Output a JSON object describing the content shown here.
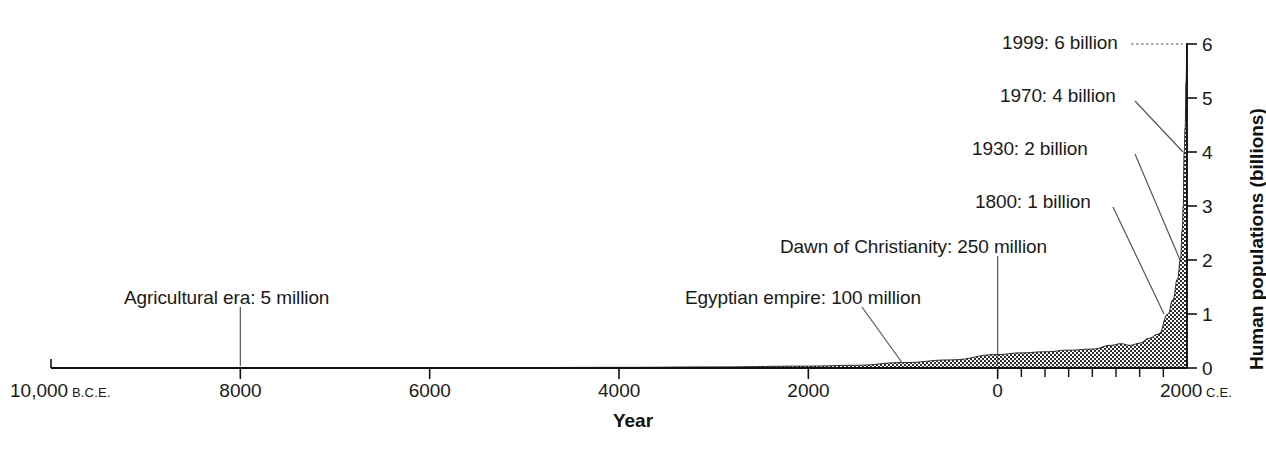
{
  "chart_data": {
    "type": "area",
    "title": "",
    "xlabel": "Year",
    "ylabel": "Human populations (billions)",
    "xlim": [
      -10000,
      2000
    ],
    "ylim": [
      0,
      6
    ],
    "grid": false,
    "legend": false,
    "x_tick_labels": [
      {
        "value": -10000,
        "text": "10,000",
        "era": "B.C.E."
      },
      {
        "value": -8000,
        "text": "8000",
        "era": ""
      },
      {
        "value": -6000,
        "text": "6000",
        "era": ""
      },
      {
        "value": -4000,
        "text": "4000",
        "era": ""
      },
      {
        "value": -2000,
        "text": "2000",
        "era": ""
      },
      {
        "value": 0,
        "text": "0",
        "era": ""
      },
      {
        "value": 2000,
        "text": "2000",
        "era": "C.E."
      }
    ],
    "x_minor_ticks": [
      250,
      500,
      750,
      1000,
      1250,
      1500,
      1750
    ],
    "y_tick_labels": [
      "0",
      "1",
      "2",
      "3",
      "4",
      "5",
      "6"
    ],
    "y_ticks": [
      0,
      1,
      2,
      3,
      4,
      5,
      6
    ],
    "series": [
      {
        "name": "World human population",
        "units": "billions",
        "points": [
          {
            "x": -10000,
            "y": 0.004
          },
          {
            "x": -9000,
            "y": 0.004
          },
          {
            "x": -8000,
            "y": 0.005
          },
          {
            "x": -7000,
            "y": 0.006
          },
          {
            "x": -6000,
            "y": 0.007
          },
          {
            "x": -5000,
            "y": 0.009
          },
          {
            "x": -4000,
            "y": 0.012
          },
          {
            "x": -3000,
            "y": 0.02
          },
          {
            "x": -2000,
            "y": 0.035
          },
          {
            "x": -1500,
            "y": 0.05
          },
          {
            "x": -1000,
            "y": 0.1
          },
          {
            "x": -500,
            "y": 0.15
          },
          {
            "x": 0,
            "y": 0.25
          },
          {
            "x": 250,
            "y": 0.28
          },
          {
            "x": 500,
            "y": 0.3
          },
          {
            "x": 750,
            "y": 0.33
          },
          {
            "x": 1000,
            "y": 0.35
          },
          {
            "x": 1200,
            "y": 0.42
          },
          {
            "x": 1300,
            "y": 0.45
          },
          {
            "x": 1400,
            "y": 0.42
          },
          {
            "x": 1500,
            "y": 0.46
          },
          {
            "x": 1600,
            "y": 0.55
          },
          {
            "x": 1700,
            "y": 0.63
          },
          {
            "x": 1800,
            "y": 1.0
          },
          {
            "x": 1850,
            "y": 1.26
          },
          {
            "x": 1900,
            "y": 1.65
          },
          {
            "x": 1930,
            "y": 2.0
          },
          {
            "x": 1950,
            "y": 2.55
          },
          {
            "x": 1960,
            "y": 3.0
          },
          {
            "x": 1970,
            "y": 4.0
          },
          {
            "x": 1980,
            "y": 4.45
          },
          {
            "x": 1990,
            "y": 5.3
          },
          {
            "x": 1999,
            "y": 6.0
          }
        ]
      }
    ],
    "annotations": [
      {
        "id": "agricultural-era",
        "label": "Agricultural era: 5 million",
        "year": -8000,
        "population_text": "5 million",
        "population_billions": 0.005,
        "leader": "vertical"
      },
      {
        "id": "egyptian-empire",
        "label": "Egyptian empire: 100 million",
        "year": -1000,
        "population_text": "100 million",
        "population_billions": 0.1,
        "leader": "diagonal"
      },
      {
        "id": "dawn-of-christianity",
        "label": "Dawn of Christianity: 250 million",
        "year": 0,
        "population_text": "250 million",
        "population_billions": 0.25,
        "leader": "vertical"
      },
      {
        "id": "1800-one-billion",
        "label": "1800: 1 billion",
        "year": 1800,
        "population_text": "1 billion",
        "population_billions": 1,
        "leader": "diagonal"
      },
      {
        "id": "1930-two-billion",
        "label": "1930: 2 billion",
        "year": 1930,
        "population_text": "2 billion",
        "population_billions": 2,
        "leader": "diagonal"
      },
      {
        "id": "1970-four-billion",
        "label": "1970: 4 billion",
        "year": 1970,
        "population_text": "4 billion",
        "population_billions": 4,
        "leader": "diagonal"
      },
      {
        "id": "1999-six-billion",
        "label": "1999: 6 billion",
        "year": 1999,
        "population_text": "6 billion",
        "population_billions": 6,
        "leader": "dotted-horizontal"
      }
    ],
    "colors": {
      "axis": "#111111",
      "fill": "#3a3a3a",
      "background": "#ffffff",
      "text": "#1a1a1a",
      "leader": "#555555"
    }
  }
}
